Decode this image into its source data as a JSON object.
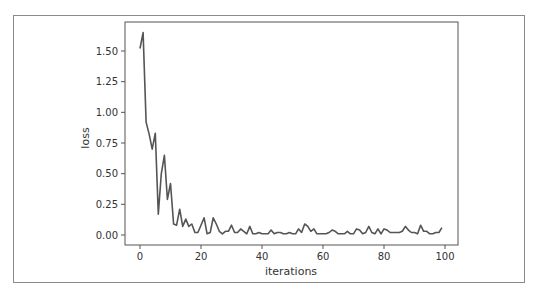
{
  "chart_data": {
    "type": "line",
    "title": "",
    "xlabel": "iterations",
    "ylabel": "loss",
    "xlim": [
      -5,
      104
    ],
    "ylim": [
      -0.08,
      1.74
    ],
    "xticks": [
      0,
      20,
      40,
      60,
      80,
      100
    ],
    "yticks": [
      0.0,
      0.25,
      0.5,
      0.75,
      1.0,
      1.25,
      1.5
    ],
    "ytick_labels": [
      "0.00",
      "0.25",
      "0.50",
      "0.75",
      "1.00",
      "1.25",
      "1.50"
    ],
    "xtick_labels": [
      "0",
      "20",
      "40",
      "60",
      "80",
      "100"
    ],
    "grid": false,
    "legend": null,
    "series": [
      {
        "name": "loss",
        "color": "#555555",
        "x": [
          0,
          1,
          2,
          3,
          4,
          5,
          6,
          7,
          8,
          9,
          10,
          11,
          12,
          13,
          14,
          15,
          16,
          17,
          18,
          19,
          20,
          21,
          22,
          23,
          24,
          25,
          26,
          27,
          28,
          29,
          30,
          31,
          32,
          33,
          34,
          35,
          36,
          37,
          38,
          39,
          40,
          41,
          42,
          43,
          44,
          45,
          46,
          47,
          48,
          49,
          50,
          51,
          52,
          53,
          54,
          55,
          56,
          57,
          58,
          59,
          60,
          61,
          62,
          63,
          64,
          65,
          66,
          67,
          68,
          69,
          70,
          71,
          72,
          73,
          74,
          75,
          76,
          77,
          78,
          79,
          80,
          81,
          82,
          83,
          84,
          85,
          86,
          87,
          88,
          89,
          90,
          91,
          92,
          93,
          94,
          95,
          96,
          97,
          98,
          99
        ],
        "values": [
          1.52,
          1.65,
          0.92,
          0.82,
          0.7,
          0.83,
          0.17,
          0.5,
          0.65,
          0.29,
          0.42,
          0.09,
          0.08,
          0.21,
          0.07,
          0.13,
          0.07,
          0.09,
          0.02,
          0.02,
          0.08,
          0.14,
          0.01,
          0.02,
          0.14,
          0.09,
          0.03,
          0.01,
          0.03,
          0.03,
          0.08,
          0.02,
          0.02,
          0.05,
          0.03,
          0.01,
          0.07,
          0.01,
          0.01,
          0.02,
          0.01,
          0.01,
          0.01,
          0.04,
          0.01,
          0.02,
          0.02,
          0.01,
          0.01,
          0.02,
          0.01,
          0.01,
          0.05,
          0.02,
          0.09,
          0.07,
          0.03,
          0.05,
          0.01,
          0.01,
          0.01,
          0.01,
          0.02,
          0.04,
          0.03,
          0.01,
          0.01,
          0.01,
          0.03,
          0.01,
          0.01,
          0.05,
          0.04,
          0.01,
          0.02,
          0.07,
          0.02,
          0.01,
          0.05,
          0.01,
          0.05,
          0.04,
          0.02,
          0.02,
          0.02,
          0.02,
          0.03,
          0.07,
          0.04,
          0.02,
          0.02,
          0.01,
          0.08,
          0.03,
          0.03,
          0.01,
          0.01,
          0.02,
          0.02,
          0.06
        ]
      }
    ]
  }
}
